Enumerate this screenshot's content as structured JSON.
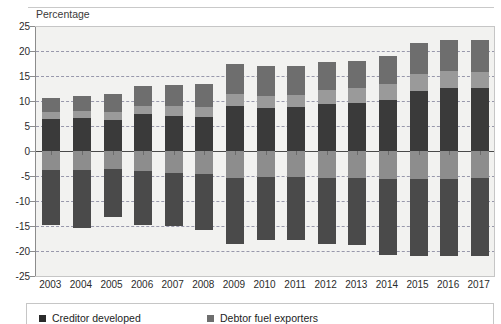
{
  "top_caption": "",
  "axis": {
    "y_unit_label": "Percentage",
    "y_ticks": [
      25,
      20,
      15,
      10,
      5,
      0,
      -5,
      -10,
      -15,
      -20,
      -25
    ],
    "y_min": -25,
    "y_max": 25
  },
  "legend": {
    "items": [
      {
        "label": "Creditor developed",
        "color": "#2b2b2b"
      },
      {
        "label": "Debtor fuel exporters",
        "color": "#6e6e6e"
      }
    ]
  },
  "colors": {
    "series_1": "#3a3a3a",
    "series_2": "#9a9a9a",
    "series_3": "#6e6e6e",
    "series_4": "#8d8d8d",
    "series_5": "#4a4a4a",
    "plot_bg": "#f2f2f0",
    "gridline": "#7a7a95",
    "axis": "#8c8c8c"
  },
  "chart_data": {
    "type": "bar",
    "stacked": true,
    "title": "",
    "xlabel": "",
    "ylabel": "Percentage",
    "ylim": [
      -25,
      25
    ],
    "grid": true,
    "legend_position": "bottom",
    "categories": [
      "2003",
      "2004",
      "2005",
      "2006",
      "2007",
      "2008",
      "2009",
      "2010",
      "2011",
      "2012",
      "2013",
      "2014",
      "2015",
      "2016",
      "2017"
    ],
    "series": [
      {
        "name": "Creditor developed",
        "color": "#3a3a3a",
        "sign": "positive",
        "values": [
          6.5,
          6.6,
          6.3,
          7.4,
          7.1,
          6.9,
          9.1,
          8.6,
          8.8,
          9.5,
          9.7,
          10.3,
          12.0,
          12.7,
          12.6
        ]
      },
      {
        "name": "Creditor other",
        "color": "#9a9a9a",
        "sign": "positive",
        "values": [
          1.4,
          1.5,
          1.6,
          1.7,
          1.9,
          2.0,
          2.4,
          2.5,
          2.5,
          2.8,
          2.9,
          3.1,
          3.4,
          3.3,
          3.3
        ]
      },
      {
        "name": "Debtor fuel exporters",
        "color": "#6e6e6e",
        "sign": "positive",
        "values": [
          2.8,
          3.0,
          3.5,
          3.9,
          4.3,
          4.5,
          5.9,
          5.9,
          5.8,
          5.6,
          5.5,
          5.6,
          6.2,
          6.3,
          6.3
        ]
      },
      {
        "name": "Debtor other",
        "color": "#8d8d8d",
        "sign": "negative",
        "values": [
          -3.7,
          -3.7,
          -3.6,
          -4.0,
          -4.3,
          -4.6,
          -5.3,
          -5.2,
          -5.2,
          -5.3,
          -5.4,
          -5.5,
          -5.5,
          -5.5,
          -5.4
        ]
      },
      {
        "name": "Debtor developed",
        "color": "#4a4a4a",
        "sign": "negative",
        "values": [
          -11.1,
          -11.7,
          -9.5,
          -10.7,
          -10.7,
          -11.2,
          -13.2,
          -12.5,
          -12.6,
          -13.3,
          -13.4,
          -15.2,
          -15.5,
          -15.5,
          -15.6
        ]
      }
    ]
  }
}
